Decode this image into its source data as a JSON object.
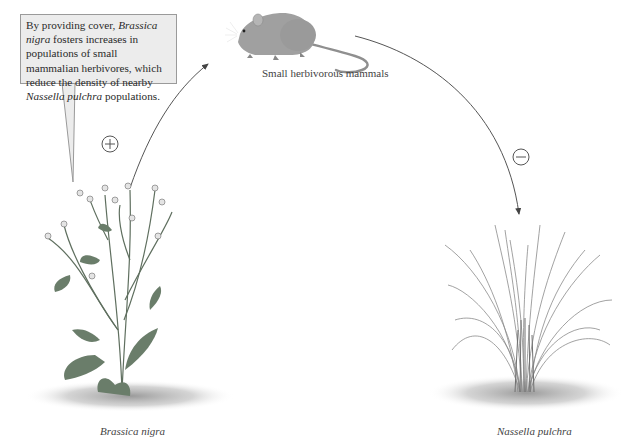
{
  "callout": {
    "text_1": "By providing cover, ",
    "species_1": "Brassica nigra",
    "text_2": " fosters increases in populations of small mammalian herbivores, which reduce the density of nearby ",
    "species_2": "Nassella pulchra",
    "text_3": " populations."
  },
  "nodes": {
    "mammal": {
      "label": "Small herbivorous mammals"
    },
    "brassica": {
      "label": "Brassica nigra"
    },
    "nassella": {
      "label": "Nassella pulchra"
    }
  },
  "edges": [
    {
      "from": "Brassica nigra",
      "to": "Small herbivorous mammals",
      "sign": "+"
    },
    {
      "from": "Small herbivorous mammals",
      "to": "Nassella pulchra",
      "sign": "−"
    }
  ],
  "colors": {
    "callout_bg": "#ececec",
    "callout_border": "#9a9a9a",
    "arrow": "#555555",
    "plant_green": "#6e8a6e",
    "mouse_gray": "#9b9b9b",
    "grass_gray": "#8a8a8a"
  }
}
